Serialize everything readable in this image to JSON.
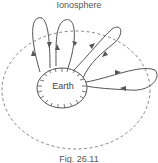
{
  "diagram": {
    "title": "Ionosphere",
    "earth_label": "Earth",
    "caption": "Fig. 26.11",
    "colors": {
      "line": "#555555",
      "dashed": "#777777",
      "text": "#555555"
    },
    "elements": [
      "earth-ellipse-hatched",
      "ionosphere-dashed-ellipse",
      "ray-loop-1",
      "ray-loop-2",
      "ray-loop-3",
      "ray-loop-4"
    ]
  }
}
